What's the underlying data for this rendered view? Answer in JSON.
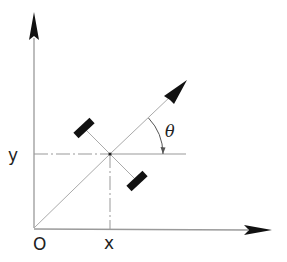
{
  "diagram": {
    "type": "robot-pose-coordinate-frame",
    "labels": {
      "origin": "O",
      "x": "x",
      "y": "y",
      "angle": "θ"
    },
    "colors": {
      "axis_line": "#9a9a9a",
      "ink": "#111111",
      "text": "#222222"
    },
    "geometry": {
      "origin": [
        34,
        228
      ],
      "robot_center": [
        110,
        154
      ],
      "heading_tip": [
        187,
        80
      ],
      "y_axis_tip": [
        34,
        12
      ],
      "x_axis_tip": [
        272,
        230
      ]
    }
  }
}
